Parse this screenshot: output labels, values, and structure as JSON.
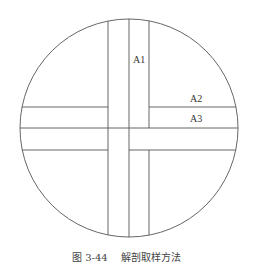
{
  "diagram": {
    "labels": {
      "a1": "A1",
      "a2": "A2",
      "a3": "A3"
    },
    "caption": {
      "number": "图 3-44",
      "title": "解剖取样方法"
    },
    "colors": {
      "line": "#555555",
      "background": "#ffffff"
    }
  }
}
